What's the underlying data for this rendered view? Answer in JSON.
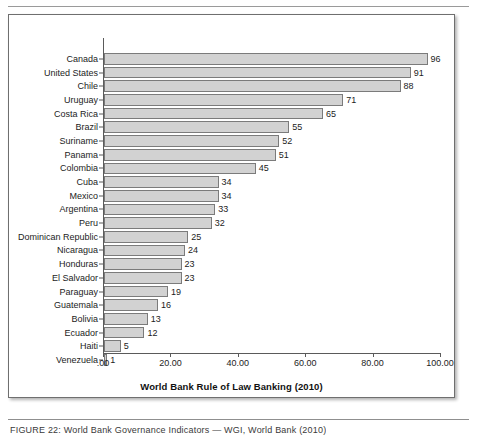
{
  "figure": {
    "caption": "FIGURE 22: World Bank Governance Indicators — WGI, World Bank (2010)"
  },
  "chart_data": {
    "type": "bar",
    "orientation": "horizontal",
    "title": "",
    "xlabel": "World Bank Rule of Law Banking (2010)",
    "ylabel": "",
    "xlim": [
      0,
      100
    ],
    "grid": false,
    "legend": null,
    "xticks": [
      {
        "value": 0,
        "label": ".00"
      },
      {
        "value": 20,
        "label": "20.00"
      },
      {
        "value": 40,
        "label": "40.00"
      },
      {
        "value": 60,
        "label": "60.00"
      },
      {
        "value": 80,
        "label": "80.00"
      },
      {
        "value": 100,
        "label": "100.00"
      }
    ],
    "categories": [
      "Canada",
      "United States",
      "Chile",
      "Uruguay",
      "Costa Rica",
      "Brazil",
      "Suriname",
      "Panama",
      "Colombia",
      "Cuba",
      "Mexico",
      "Argentina",
      "Peru",
      "Dominican Republic",
      "Nicaragua",
      "Honduras",
      "El Salvador",
      "Paraguay",
      "Guatemala",
      "Bolivia",
      "Ecuador",
      "Haiti",
      "Venezuela"
    ],
    "values": [
      96,
      91,
      88,
      71,
      65,
      55,
      52,
      51,
      45,
      34,
      34,
      33,
      32,
      25,
      24,
      23,
      23,
      19,
      16,
      13,
      12,
      5,
      1
    ],
    "value_labels": [
      "96",
      "91",
      "88",
      "71",
      "65",
      "55",
      "52",
      "51",
      "45",
      "34",
      "34",
      "33",
      "32",
      "25",
      "24",
      "23",
      "23",
      "19",
      "16",
      "13",
      "12",
      "5",
      "1"
    ],
    "colors": {
      "bar_fill": "#d2d2d2",
      "bar_border": "#7b7b7b",
      "axis": "#5a5a5a",
      "text": "#1c1c1c"
    }
  }
}
